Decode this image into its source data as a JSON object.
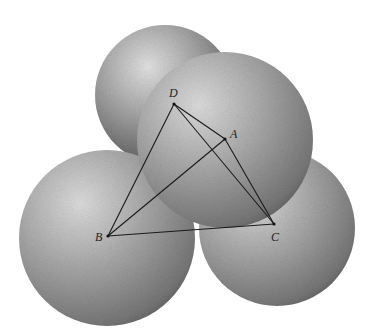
{
  "figure": {
    "colors": {
      "background": "#ffffff",
      "sphere_light": "#d8d8d8",
      "sphere_mid": "#9a9a9a",
      "sphere_dark": "#4a4a4a",
      "line": "#1a1a1a"
    },
    "spheres": [
      {
        "name": "back-sphere",
        "cx": 165,
        "cy": 95,
        "r": 70
      },
      {
        "name": "left-sphere",
        "cx": 107,
        "cy": 238,
        "r": 88
      },
      {
        "name": "right-sphere",
        "cx": 277,
        "cy": 228,
        "r": 78
      },
      {
        "name": "front-sphere",
        "cx": 225,
        "cy": 140,
        "r": 88
      }
    ],
    "points": {
      "A": {
        "label": "A",
        "x": 225,
        "y": 139,
        "lx": 230,
        "ly": 138
      },
      "B": {
        "label": "B",
        "x": 108,
        "y": 236,
        "lx": 95,
        "ly": 241
      },
      "C": {
        "label": "C",
        "x": 274,
        "y": 224,
        "lx": 271,
        "ly": 241
      },
      "D": {
        "label": "D",
        "x": 174,
        "y": 104,
        "lx": 169,
        "ly": 97
      }
    },
    "edges": [
      [
        "D",
        "A"
      ],
      [
        "D",
        "B"
      ],
      [
        "D",
        "C"
      ],
      [
        "A",
        "B"
      ],
      [
        "A",
        "C"
      ],
      [
        "B",
        "C"
      ]
    ]
  }
}
